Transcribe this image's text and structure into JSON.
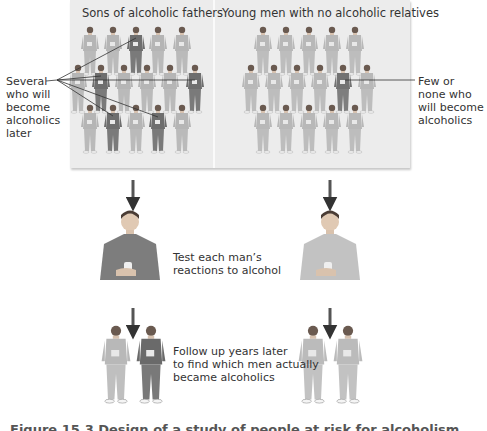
{
  "panel": {
    "left_title": "Sons of alcoholic fathers",
    "right_title": "Young men with no alcoholic relatives"
  },
  "annotations": {
    "left": [
      "Several",
      "who will",
      "become",
      "alcoholics",
      "later"
    ],
    "right": [
      "Few or",
      "none who",
      "will become",
      "alcoholics"
    ]
  },
  "steps": {
    "test": [
      "Test each man’s",
      "reactions to alcohol"
    ],
    "follow_up": [
      "Follow up years later",
      "to find which men actually",
      "became alcoholics"
    ]
  },
  "caption": "Figure 15.3 Design of a study of people at risk for alcoholism",
  "colors": {
    "light_figure": "#b9b9b9",
    "dark_figure": "#6e6e6e",
    "panel_bg": "#ececec",
    "arrow": "#333333"
  }
}
